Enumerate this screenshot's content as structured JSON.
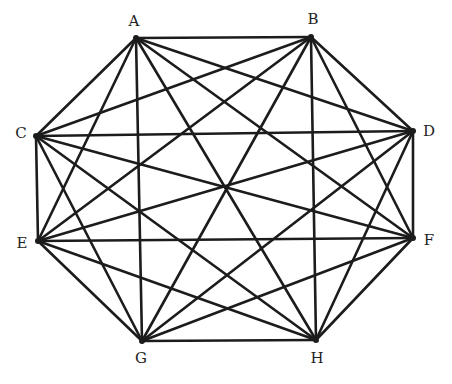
{
  "diagram": {
    "type": "complete-graph",
    "name": "K8",
    "colors": {
      "edge": "#1c1c1c",
      "label": "#222222",
      "background": "#ffffff"
    },
    "nodes": [
      {
        "id": "A",
        "label": "A",
        "x": 136,
        "y": 38,
        "lx": 134,
        "ly": 26
      },
      {
        "id": "B",
        "label": "B",
        "x": 311,
        "y": 37,
        "lx": 313,
        "ly": 24
      },
      {
        "id": "C",
        "label": "C",
        "x": 36,
        "y": 136,
        "lx": 21,
        "ly": 138
      },
      {
        "id": "D",
        "label": "D",
        "x": 413,
        "y": 131,
        "lx": 429,
        "ly": 136
      },
      {
        "id": "E",
        "label": "E",
        "x": 38,
        "y": 241,
        "lx": 22,
        "ly": 248
      },
      {
        "id": "F",
        "label": "F",
        "x": 413,
        "y": 238,
        "lx": 429,
        "ly": 245
      },
      {
        "id": "G",
        "label": "G",
        "x": 142,
        "y": 341,
        "lx": 141,
        "ly": 363
      },
      {
        "id": "H",
        "label": "H",
        "x": 316,
        "y": 340,
        "lx": 317,
        "ly": 363
      }
    ],
    "edges": [
      [
        "A",
        "B"
      ],
      [
        "A",
        "C"
      ],
      [
        "A",
        "D"
      ],
      [
        "A",
        "E"
      ],
      [
        "A",
        "F"
      ],
      [
        "A",
        "G"
      ],
      [
        "A",
        "H"
      ],
      [
        "B",
        "C"
      ],
      [
        "B",
        "D"
      ],
      [
        "B",
        "E"
      ],
      [
        "B",
        "F"
      ],
      [
        "B",
        "G"
      ],
      [
        "B",
        "H"
      ],
      [
        "C",
        "D"
      ],
      [
        "C",
        "E"
      ],
      [
        "C",
        "F"
      ],
      [
        "C",
        "G"
      ],
      [
        "C",
        "H"
      ],
      [
        "D",
        "E"
      ],
      [
        "D",
        "F"
      ],
      [
        "D",
        "G"
      ],
      [
        "D",
        "H"
      ],
      [
        "E",
        "F"
      ],
      [
        "E",
        "G"
      ],
      [
        "E",
        "H"
      ],
      [
        "F",
        "G"
      ],
      [
        "F",
        "H"
      ],
      [
        "G",
        "H"
      ]
    ]
  }
}
